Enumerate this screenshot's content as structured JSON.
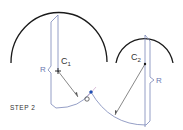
{
  "diagram": {
    "step_label": "STEP 2",
    "labels": {
      "c1_main": "C",
      "c1_sub": "1",
      "c2_main": "C",
      "c2_sub": "2",
      "radius_left": "R",
      "radius_right": "R",
      "tangent_point": "O"
    },
    "colors": {
      "arc": "#1a1a1a",
      "dimension": "#7a86b8",
      "construction": "#555555",
      "point": "#1f4fb3",
      "text": "#333333",
      "label_blue": "#6b78b0"
    }
  }
}
